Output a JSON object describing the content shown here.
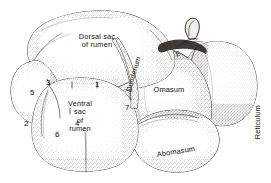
{
  "figure": {
    "kind": "anatomical-line-drawing",
    "background_color": "#ffffff",
    "ink_color": "#15120f"
  },
  "labels": {
    "dorsal_sac": "Dorsal sac\nof rumen",
    "ventral_sac": "Ventral\nsac\nof\nrumen",
    "duodenum": "Duodenum",
    "omasum": "Omasum",
    "abomasum": "Abomasum",
    "reticulum": "Reticulum",
    "esophagus": "E"
  },
  "callouts": [
    {
      "id": "callout-1",
      "text": "1"
    },
    {
      "id": "callout-2",
      "text": "2"
    },
    {
      "id": "callout-3",
      "text": "3"
    },
    {
      "id": "callout-4",
      "text": "4"
    },
    {
      "id": "callout-5",
      "text": "5"
    },
    {
      "id": "callout-6",
      "text": "6"
    },
    {
      "id": "callout-7",
      "text": "7"
    }
  ]
}
